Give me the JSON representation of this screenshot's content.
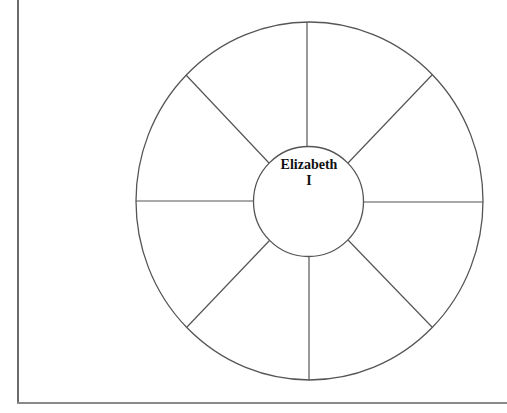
{
  "diagram": {
    "type": "spoke-wheel-graphic-organizer",
    "center_label": {
      "line1": "Elizabeth",
      "line2": "I"
    },
    "spoke_count": 8,
    "segments": [
      "",
      "",
      "",
      "",
      "",
      "",
      "",
      ""
    ],
    "colors": {
      "stroke": "#555555",
      "frame": "#6b6b6b",
      "text": "#111111",
      "background": "#ffffff"
    }
  }
}
